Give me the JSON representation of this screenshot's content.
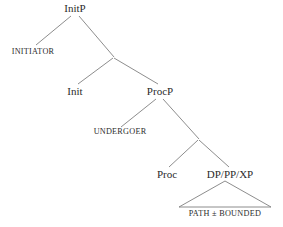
{
  "figure": {
    "type": "syntax-tree",
    "background_color": "#ffffff",
    "line_color": "#808080",
    "text_color": "#2b2b2b"
  },
  "nodes": {
    "initp": {
      "label": "InitP",
      "x": 75,
      "y": 9
    },
    "initiator": {
      "label": "INITIATOR",
      "x": 33,
      "y": 53
    },
    "init": {
      "label": "Init",
      "x": 75,
      "y": 92
    },
    "procp": {
      "label": "ProcP",
      "x": 160,
      "y": 92
    },
    "undergoer": {
      "label": "UNDERGOER",
      "x": 120,
      "y": 133
    },
    "proc": {
      "label": "Proc",
      "x": 167,
      "y": 175
    },
    "dp_pp_xp": {
      "label": "DP/PP/XP",
      "x": 230,
      "y": 175
    },
    "path_bounded": {
      "label": "PATH ± BOUNDED",
      "x": 225,
      "y": 215
    }
  },
  "branches": [
    {
      "name": "initp-to-initiator",
      "x1": 71,
      "y1": 16,
      "x2": 36,
      "y2": 45
    },
    {
      "name": "initp-to-bar",
      "x1": 79,
      "y1": 16,
      "x2": 114,
      "y2": 57
    },
    {
      "name": "bar-to-init",
      "x1": 113,
      "y1": 58,
      "x2": 78,
      "y2": 84
    },
    {
      "name": "bar-to-procp",
      "x1": 114,
      "y1": 58,
      "x2": 158,
      "y2": 84
    },
    {
      "name": "procp-to-undergoer",
      "x1": 156,
      "y1": 99,
      "x2": 121,
      "y2": 127
    },
    {
      "name": "procp-to-bar2",
      "x1": 163,
      "y1": 99,
      "x2": 199,
      "y2": 139
    },
    {
      "name": "bar2-to-proc",
      "x1": 198,
      "y1": 140,
      "x2": 169,
      "y2": 167
    },
    {
      "name": "bar2-to-dppp",
      "x1": 199,
      "y1": 140,
      "x2": 229,
      "y2": 167
    }
  ],
  "triangle": {
    "name": "path-bounded-triangle",
    "apex_x": 225,
    "apex_y": 181,
    "left_x": 179,
    "right_x": 271,
    "base_y": 207
  }
}
